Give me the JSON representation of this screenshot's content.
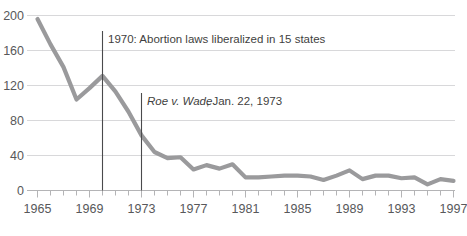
{
  "chart_data": {
    "type": "line",
    "title": "",
    "subtitle": "",
    "xlabel": "",
    "ylabel": "",
    "xlim": [
      1965,
      1997
    ],
    "ylim": [
      0,
      200
    ],
    "grid": true,
    "legend_position": "none",
    "line_color": "#9a9a9c",
    "gridline_color": "#d8d8da",
    "axis_color": "#b4b4b6",
    "marker_line_color": "#4a4a4c",
    "text_color": "#58585a",
    "background_color": "#ffffff",
    "y_ticks": [
      0,
      40,
      80,
      120,
      160,
      200
    ],
    "y_tick_labels": [
      "0",
      "40",
      "80",
      "120",
      "160",
      "200"
    ],
    "x_ticks": [
      1965,
      1969,
      1973,
      1977,
      1981,
      1985,
      1989,
      1993,
      1997
    ],
    "x_tick_labels": [
      "1965",
      "1969",
      "1973",
      "1977",
      "1981",
      "1985",
      "1989",
      "1993",
      "1997"
    ],
    "x_minor_tick_step": 1,
    "x": [
      1965,
      1966,
      1967,
      1968,
      1969,
      1970,
      1971,
      1972,
      1973,
      1974,
      1975,
      1976,
      1977,
      1978,
      1979,
      1980,
      1981,
      1982,
      1983,
      1984,
      1985,
      1986,
      1987,
      1988,
      1989,
      1990,
      1991,
      1992,
      1993,
      1994,
      1995,
      1996,
      1997
    ],
    "values": [
      196,
      167,
      141,
      104,
      117,
      131,
      113,
      90,
      63,
      44,
      37,
      38,
      24,
      29,
      25,
      30,
      15,
      15,
      16,
      17,
      17,
      16,
      12,
      17,
      23,
      13,
      17,
      17,
      14,
      15,
      7,
      13,
      11
    ],
    "series": [
      {
        "name": "Maternal deaths from abortion (number)",
        "values": [
          196,
          167,
          141,
          104,
          117,
          131,
          113,
          90,
          63,
          44,
          37,
          38,
          24,
          29,
          25,
          30,
          15,
          15,
          16,
          17,
          17,
          16,
          12,
          17,
          23,
          13,
          17,
          17,
          14,
          15,
          7,
          13,
          11
        ]
      }
    ],
    "annotations": [
      {
        "id": "annotation-1970",
        "text": "1970: Abortion laws liberalized in 15 states",
        "italic_prefix": "",
        "x_value": 1970,
        "line_top_y": 200,
        "line_bottom_y": 0
      },
      {
        "id": "annotation-roe-v-wade",
        "text_italic": "Roe v. Wade",
        "text_rest": ", Jan. 22, 1973",
        "x_value": 1973,
        "line_top_y": 112,
        "line_bottom_y": 0
      }
    ]
  }
}
